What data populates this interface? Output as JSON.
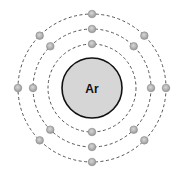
{
  "diagram": {
    "type": "bohr-model",
    "element_symbol": "Ar",
    "center": [
      92,
      88
    ],
    "nucleus": {
      "radius": 30,
      "fill": "#d6d6d6",
      "stroke": "#111111"
    },
    "shell_style": {
      "stroke": "#555555",
      "dash": "3 2.5"
    },
    "electron_style": {
      "radius": 3.8,
      "fill": "#a8a8a8",
      "highlight": "#d0d0d0",
      "stroke": "#8a8a8a"
    },
    "shells": [
      {
        "name": "shell-1",
        "radius": 44,
        "electron_count": 2,
        "electron_angles": [
          90,
          270
        ]
      },
      {
        "name": "shell-2",
        "radius": 59,
        "electron_count": 8,
        "electron_angles": [
          0,
          45,
          90,
          135,
          180,
          225,
          270,
          315
        ]
      },
      {
        "name": "shell-3",
        "radius": 74,
        "electron_count": 8,
        "electron_angles": [
          0,
          45,
          90,
          135,
          180,
          225,
          270,
          315
        ]
      }
    ]
  }
}
